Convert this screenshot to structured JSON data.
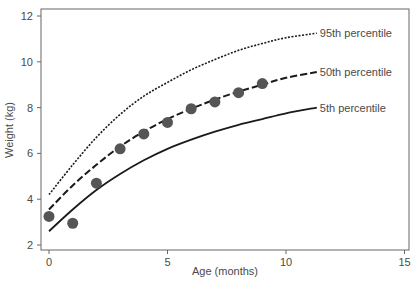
{
  "chart_data": {
    "type": "line",
    "title": "",
    "xlabel": "Age (months)",
    "ylabel": "Weight (kg)",
    "xlim": [
      0,
      15
    ],
    "ylim": [
      2,
      12
    ],
    "xticks": [
      0,
      5,
      10,
      15
    ],
    "yticks": [
      2,
      4,
      6,
      8,
      10,
      12
    ],
    "grid": false,
    "legend": "inline labels at right end of each curve",
    "series": [
      {
        "name": "95th percentile",
        "style": "dotted",
        "x": [
          0,
          1,
          2,
          3,
          4,
          5,
          6,
          7,
          8,
          9,
          10,
          11.3
        ],
        "values": [
          4.2,
          5.5,
          6.7,
          7.7,
          8.5,
          9.1,
          9.65,
          10.1,
          10.5,
          10.8,
          11.05,
          11.25
        ]
      },
      {
        "name": "50th percentile",
        "style": "dashed",
        "x": [
          0,
          1,
          2,
          3,
          4,
          5,
          6,
          7,
          8,
          9,
          10,
          11.3
        ],
        "values": [
          3.55,
          4.6,
          5.5,
          6.3,
          6.95,
          7.5,
          7.95,
          8.35,
          8.7,
          9.0,
          9.3,
          9.55
        ]
      },
      {
        "name": "5th percentile",
        "style": "solid",
        "x": [
          0,
          1,
          2,
          3,
          4,
          5,
          6,
          7,
          8,
          9,
          10,
          11.3
        ],
        "values": [
          2.6,
          3.55,
          4.4,
          5.1,
          5.7,
          6.2,
          6.6,
          6.95,
          7.25,
          7.5,
          7.75,
          8.0
        ]
      },
      {
        "name": "Measured weight",
        "style": "scatter",
        "x": [
          0,
          1,
          2,
          3,
          4,
          5,
          6,
          7,
          8,
          9
        ],
        "values": [
          3.25,
          2.95,
          4.7,
          6.2,
          6.85,
          7.35,
          7.95,
          8.25,
          8.65,
          9.05
        ]
      }
    ]
  },
  "colors": {
    "line": "#1a1a1a",
    "marker": "#555555",
    "axis": "#555555",
    "text": "#4a4a4a"
  }
}
